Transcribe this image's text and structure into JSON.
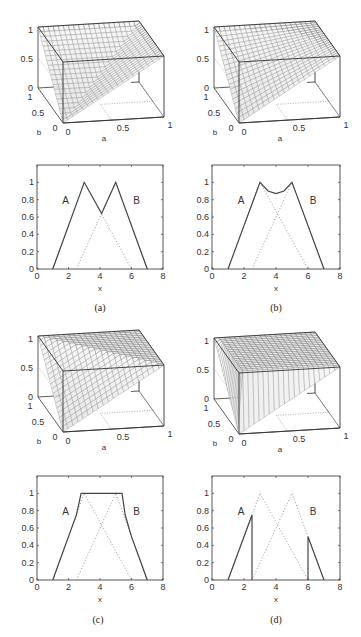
{
  "figure": {
    "panels": [
      {
        "id": "a",
        "caption": "(a)"
      },
      {
        "id": "b",
        "caption": "(b)"
      },
      {
        "id": "c",
        "caption": "(c)"
      },
      {
        "id": "d",
        "caption": "(d)"
      }
    ]
  },
  "chart_data": [
    {
      "panel": "a",
      "type": "surface",
      "title": "",
      "xlabel": "a",
      "ylabel": "b",
      "zlabel": "",
      "x_ticks": [
        "0",
        "0.5",
        "1"
      ],
      "y_ticks": [
        "0",
        "0.5",
        "1"
      ],
      "z_ticks": [
        "0",
        "0.5",
        "1"
      ],
      "xlim": [
        0,
        1
      ],
      "ylim": [
        0,
        1
      ],
      "zlim": [
        0,
        1
      ],
      "surface": "z = max(a, b) (S-norm, maximum)"
    },
    {
      "panel": "a",
      "type": "line",
      "xlabel": "x",
      "ylabel": "",
      "x_ticks": [
        "0",
        "2",
        "4",
        "6",
        "8"
      ],
      "y_ticks": [
        "0",
        "0.2",
        "0.4",
        "0.6",
        "0.8",
        "1"
      ],
      "xlim": [
        0,
        8
      ],
      "ylim": [
        0,
        1.2
      ],
      "annotations": [
        "A",
        "B"
      ],
      "series": [
        {
          "name": "A",
          "style": "dotted",
          "x": [
            1,
            3,
            6
          ],
          "y": [
            0,
            1,
            0
          ]
        },
        {
          "name": "B",
          "style": "dotted",
          "x": [
            2.5,
            5,
            7
          ],
          "y": [
            0,
            1,
            0
          ]
        },
        {
          "name": "union",
          "style": "solid",
          "x": [
            1,
            3,
            4.1,
            5,
            7
          ],
          "y": [
            0,
            1,
            0.64,
            1,
            0
          ]
        }
      ]
    },
    {
      "panel": "b",
      "type": "surface",
      "xlabel": "a",
      "ylabel": "b",
      "x_ticks": [
        "0",
        "0.5",
        "1"
      ],
      "y_ticks": [
        "0",
        "0.5",
        "1"
      ],
      "z_ticks": [
        "0",
        "0.5",
        "1"
      ],
      "xlim": [
        0,
        1
      ],
      "ylim": [
        0,
        1
      ],
      "zlim": [
        0,
        1
      ],
      "surface": "z = a + b - ab (algebraic sum)"
    },
    {
      "panel": "b",
      "type": "line",
      "xlabel": "x",
      "x_ticks": [
        "0",
        "2",
        "4",
        "6",
        "8"
      ],
      "y_ticks": [
        "0",
        "0.2",
        "0.4",
        "0.6",
        "0.8",
        "1"
      ],
      "xlim": [
        0,
        8
      ],
      "ylim": [
        0,
        1.2
      ],
      "annotations": [
        "A",
        "B"
      ],
      "series": [
        {
          "name": "A",
          "style": "dotted",
          "x": [
            1,
            3,
            6
          ],
          "y": [
            0,
            1,
            0
          ]
        },
        {
          "name": "B",
          "style": "dotted",
          "x": [
            2.5,
            5,
            7
          ],
          "y": [
            0,
            1,
            0
          ]
        },
        {
          "name": "union",
          "style": "solid",
          "x": [
            1,
            2,
            2.5,
            3,
            3.5,
            4,
            4.5,
            5,
            6,
            7
          ],
          "y": [
            0,
            0.5,
            0.75,
            1,
            0.9,
            0.87,
            0.9,
            1,
            0.5,
            0
          ]
        }
      ]
    },
    {
      "panel": "c",
      "type": "surface",
      "xlabel": "a",
      "ylabel": "b",
      "x_ticks": [
        "0",
        "0.5",
        "1"
      ],
      "y_ticks": [
        "0",
        "0.5",
        "1"
      ],
      "z_ticks": [
        "0",
        "0.5",
        "1"
      ],
      "xlim": [
        0,
        1
      ],
      "ylim": [
        0,
        1
      ],
      "zlim": [
        0,
        1
      ],
      "surface": "z = min(1, a + b) (bounded sum)"
    },
    {
      "panel": "c",
      "type": "line",
      "xlabel": "x",
      "x_ticks": [
        "0",
        "2",
        "4",
        "6",
        "8"
      ],
      "y_ticks": [
        "0",
        "0.2",
        "0.4",
        "0.6",
        "0.8",
        "1"
      ],
      "xlim": [
        0,
        8
      ],
      "ylim": [
        0,
        1.2
      ],
      "annotations": [
        "A",
        "B"
      ],
      "series": [
        {
          "name": "A",
          "style": "dotted",
          "x": [
            1,
            3,
            6
          ],
          "y": [
            0,
            1,
            0
          ]
        },
        {
          "name": "B",
          "style": "dotted",
          "x": [
            2.5,
            5,
            7
          ],
          "y": [
            0,
            1,
            0
          ]
        },
        {
          "name": "union",
          "style": "solid",
          "x": [
            1,
            2,
            2.5,
            2.8,
            5.4,
            5.6,
            6,
            7
          ],
          "y": [
            0,
            0.5,
            0.75,
            1,
            1,
            0.75,
            0.5,
            0
          ]
        }
      ]
    },
    {
      "panel": "d",
      "type": "surface",
      "xlabel": "a",
      "ylabel": "b",
      "x_ticks": [
        "0",
        "0.5",
        "1"
      ],
      "y_ticks": [
        "0",
        "0.5",
        "1"
      ],
      "z_ticks": [
        "0",
        "0.5",
        "1"
      ],
      "xlim": [
        0,
        1
      ],
      "ylim": [
        0,
        1
      ],
      "zlim": [
        0,
        1
      ],
      "surface": "z = a if b=0; b if a=0; 1 otherwise (drastic sum)"
    },
    {
      "panel": "d",
      "type": "line",
      "xlabel": "x",
      "x_ticks": [
        "0",
        "2",
        "4",
        "6",
        "8"
      ],
      "y_ticks": [
        "0",
        "0.2",
        "0.4",
        "0.6",
        "0.8",
        "1"
      ],
      "xlim": [
        0,
        8
      ],
      "ylim": [
        0,
        1.2
      ],
      "annotations": [
        "A",
        "B"
      ],
      "series": [
        {
          "name": "A",
          "style": "dotted",
          "x": [
            1,
            3,
            6
          ],
          "y": [
            0,
            1,
            0
          ]
        },
        {
          "name": "B",
          "style": "dotted",
          "x": [
            2.5,
            5,
            7
          ],
          "y": [
            0,
            1,
            0
          ]
        },
        {
          "name": "union-left",
          "style": "solid",
          "x": [
            1,
            2.5,
            2.5
          ],
          "y": [
            0,
            0.75,
            0
          ]
        },
        {
          "name": "union-right",
          "style": "solid",
          "x": [
            6,
            6,
            7
          ],
          "y": [
            0,
            0.5,
            0
          ]
        }
      ]
    }
  ]
}
